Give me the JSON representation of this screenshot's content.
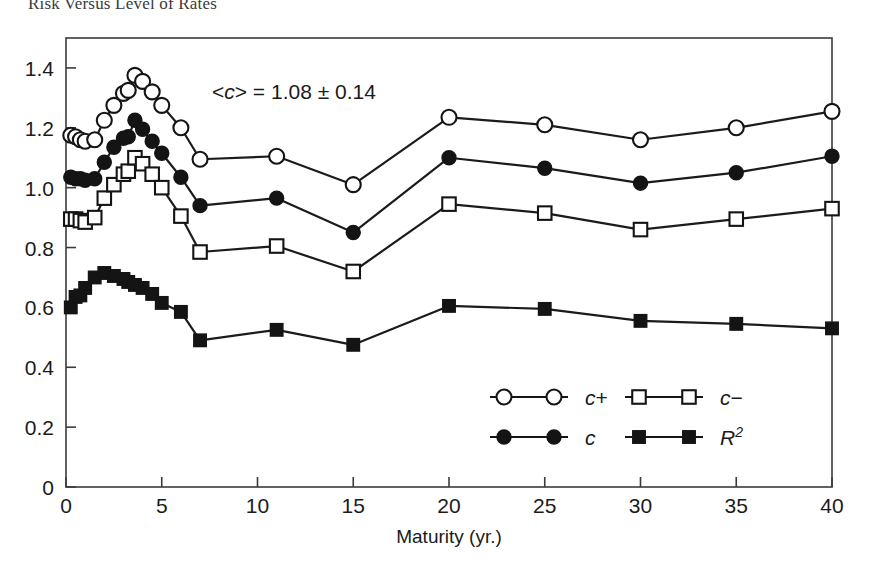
{
  "figure": {
    "title": "Risk Versus Level of Rates",
    "background": "#ffffff",
    "ink": "#1b1b1b"
  },
  "chart_data": {
    "type": "line",
    "title": "Risk Versus Level of Rates",
    "xlabel": "Maturity (yr.)",
    "ylabel": "",
    "xlim": [
      0,
      40
    ],
    "ylim": [
      0,
      1.5
    ],
    "xticks": [
      0,
      5,
      10,
      15,
      20,
      25,
      30,
      35,
      40
    ],
    "xtick_labels": [
      "0",
      "5",
      "10",
      "15",
      "20",
      "25",
      "30",
      "35",
      "40"
    ],
    "yticks": [
      0,
      0.2,
      0.4,
      0.6,
      0.8,
      1.0,
      1.2,
      1.4
    ],
    "ytick_labels": [
      "0",
      "0.2",
      "0.4",
      "0.6",
      "0.8",
      "1.0",
      "1.2",
      "1.4"
    ],
    "grid": false,
    "legend_position": "lower-center-right",
    "annotations": [
      {
        "text_plain": "<c> = 1.08 ± 0.14",
        "pre": "<",
        "italic": "c",
        "post": "> = 1.08 ± 0.14",
        "x": 7.5,
        "y": 1.38
      }
    ],
    "series": [
      {
        "name": "c+",
        "label_pre": "c",
        "label_post": "+",
        "marker": "open-circle",
        "color": "#1b1b1b",
        "points": [
          {
            "x": 0.25,
            "y": 1.175
          },
          {
            "x": 0.5,
            "y": 1.17
          },
          {
            "x": 0.75,
            "y": 1.16
          },
          {
            "x": 1.0,
            "y": 1.155
          },
          {
            "x": 1.5,
            "y": 1.16
          },
          {
            "x": 2.0,
            "y": 1.225
          },
          {
            "x": 2.5,
            "y": 1.275
          },
          {
            "x": 3.0,
            "y": 1.315
          },
          {
            "x": 3.25,
            "y": 1.325
          },
          {
            "x": 3.6,
            "y": 1.375
          },
          {
            "x": 4.0,
            "y": 1.355
          },
          {
            "x": 4.5,
            "y": 1.32
          },
          {
            "x": 5.0,
            "y": 1.275
          },
          {
            "x": 6.0,
            "y": 1.2
          },
          {
            "x": 7.0,
            "y": 1.095
          },
          {
            "x": 11.0,
            "y": 1.105
          },
          {
            "x": 15.0,
            "y": 1.01
          },
          {
            "x": 20.0,
            "y": 1.235
          },
          {
            "x": 25.0,
            "y": 1.21
          },
          {
            "x": 30.0,
            "y": 1.16
          },
          {
            "x": 35.0,
            "y": 1.2
          },
          {
            "x": 40.0,
            "y": 1.255
          }
        ]
      },
      {
        "name": "c",
        "label_pre": "c",
        "label_post": "",
        "marker": "filled-circle",
        "color": "#1b1b1b",
        "points": [
          {
            "x": 0.25,
            "y": 1.035
          },
          {
            "x": 0.5,
            "y": 1.03
          },
          {
            "x": 0.75,
            "y": 1.03
          },
          {
            "x": 1.0,
            "y": 1.025
          },
          {
            "x": 1.5,
            "y": 1.03
          },
          {
            "x": 2.0,
            "y": 1.085
          },
          {
            "x": 2.5,
            "y": 1.135
          },
          {
            "x": 3.0,
            "y": 1.165
          },
          {
            "x": 3.25,
            "y": 1.17
          },
          {
            "x": 3.6,
            "y": 1.225
          },
          {
            "x": 4.0,
            "y": 1.195
          },
          {
            "x": 4.5,
            "y": 1.155
          },
          {
            "x": 5.0,
            "y": 1.115
          },
          {
            "x": 6.0,
            "y": 1.035
          },
          {
            "x": 7.0,
            "y": 0.94
          },
          {
            "x": 11.0,
            "y": 0.965
          },
          {
            "x": 15.0,
            "y": 0.85
          },
          {
            "x": 20.0,
            "y": 1.1
          },
          {
            "x": 25.0,
            "y": 1.065
          },
          {
            "x": 30.0,
            "y": 1.015
          },
          {
            "x": 35.0,
            "y": 1.05
          },
          {
            "x": 40.0,
            "y": 1.105
          }
        ]
      },
      {
        "name": "c-",
        "label_pre": "c",
        "label_post": "−",
        "marker": "open-square",
        "color": "#1b1b1b",
        "points": [
          {
            "x": 0.25,
            "y": 0.895
          },
          {
            "x": 0.5,
            "y": 0.895
          },
          {
            "x": 0.75,
            "y": 0.89
          },
          {
            "x": 1.0,
            "y": 0.885
          },
          {
            "x": 1.5,
            "y": 0.9
          },
          {
            "x": 2.0,
            "y": 0.965
          },
          {
            "x": 2.5,
            "y": 1.01
          },
          {
            "x": 3.0,
            "y": 1.045
          },
          {
            "x": 3.25,
            "y": 1.055
          },
          {
            "x": 3.6,
            "y": 1.1
          },
          {
            "x": 4.0,
            "y": 1.08
          },
          {
            "x": 4.5,
            "y": 1.045
          },
          {
            "x": 5.0,
            "y": 1.0
          },
          {
            "x": 6.0,
            "y": 0.905
          },
          {
            "x": 7.0,
            "y": 0.785
          },
          {
            "x": 11.0,
            "y": 0.805
          },
          {
            "x": 15.0,
            "y": 0.72
          },
          {
            "x": 20.0,
            "y": 0.945
          },
          {
            "x": 25.0,
            "y": 0.915
          },
          {
            "x": 30.0,
            "y": 0.86
          },
          {
            "x": 35.0,
            "y": 0.895
          },
          {
            "x": 40.0,
            "y": 0.93
          }
        ]
      },
      {
        "name": "R2",
        "label_pre": "R",
        "label_post": "2",
        "marker": "filled-square",
        "color": "#1b1b1b",
        "points": [
          {
            "x": 0.25,
            "y": 0.6
          },
          {
            "x": 0.5,
            "y": 0.635
          },
          {
            "x": 0.75,
            "y": 0.64
          },
          {
            "x": 1.0,
            "y": 0.665
          },
          {
            "x": 1.5,
            "y": 0.7
          },
          {
            "x": 2.0,
            "y": 0.715
          },
          {
            "x": 2.5,
            "y": 0.705
          },
          {
            "x": 3.0,
            "y": 0.695
          },
          {
            "x": 3.25,
            "y": 0.685
          },
          {
            "x": 3.6,
            "y": 0.675
          },
          {
            "x": 4.0,
            "y": 0.665
          },
          {
            "x": 4.5,
            "y": 0.645
          },
          {
            "x": 5.0,
            "y": 0.615
          },
          {
            "x": 6.0,
            "y": 0.585
          },
          {
            "x": 7.0,
            "y": 0.49
          },
          {
            "x": 11.0,
            "y": 0.525
          },
          {
            "x": 15.0,
            "y": 0.475
          },
          {
            "x": 20.0,
            "y": 0.605
          },
          {
            "x": 25.0,
            "y": 0.595
          },
          {
            "x": 30.0,
            "y": 0.555
          },
          {
            "x": 35.0,
            "y": 0.545
          },
          {
            "x": 40.0,
            "y": 0.53
          }
        ]
      }
    ],
    "legend": [
      {
        "name": "c+",
        "marker": "open-circle",
        "pre": "c",
        "post": "+",
        "sup": ""
      },
      {
        "name": "c-",
        "marker": "open-square",
        "pre": "c",
        "post": "−",
        "sup": ""
      },
      {
        "name": "c",
        "marker": "filled-circle",
        "pre": "c",
        "post": "",
        "sup": ""
      },
      {
        "name": "R2",
        "marker": "filled-square",
        "pre": "R",
        "post": "",
        "sup": "2"
      }
    ]
  }
}
